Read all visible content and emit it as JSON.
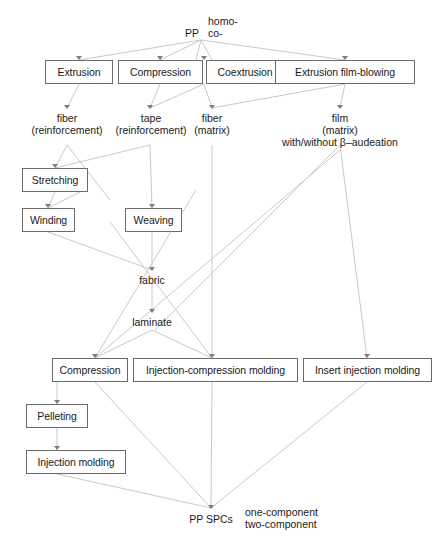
{
  "diagram": {
    "line_color": "#c9c9c9",
    "box_border_color": "#6b6b6b",
    "source": {
      "label": "PP",
      "variant_1": "homo-",
      "variant_2": "co-"
    },
    "process_row_1": [
      {
        "label": "Extrusion"
      },
      {
        "label": "Compression"
      },
      {
        "label": "Coextrusion"
      },
      {
        "label": "Extrusion film-blowing"
      }
    ],
    "intermediate_row_1": [
      {
        "line1": "fiber",
        "line2": "(reinforcement)",
        "line3": ""
      },
      {
        "line1": "tape",
        "line2": "(reinforcement)",
        "line3": ""
      },
      {
        "line1": "fiber",
        "line2": "(matrix)",
        "line3": ""
      },
      {
        "line1": "film",
        "line2": "(matrix)",
        "line3": "with/without β–audeation"
      }
    ],
    "process_row_2": [
      {
        "label": "Stretching"
      },
      {
        "label": "Winding"
      },
      {
        "label": "Weaving"
      }
    ],
    "intermediate_row_2": [
      {
        "label": "fabric"
      },
      {
        "label": "laminate"
      }
    ],
    "process_row_3": [
      {
        "label": "Compression"
      },
      {
        "label": "Injection-compression molding"
      },
      {
        "label": "Insert injection molding"
      }
    ],
    "process_row_4": [
      {
        "label": "Pelleting"
      },
      {
        "label": "Injection molding"
      }
    ],
    "product": {
      "label": "PP SPCs",
      "option_1": "one-component",
      "option_2": "two-component"
    }
  }
}
